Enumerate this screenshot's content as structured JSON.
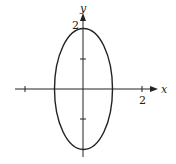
{
  "figure": {
    "type": "ellipse-plot",
    "equation": "x^2 + y^2/4 = 1",
    "axes": {
      "x_label": "x",
      "y_label": "y",
      "x_tick_labels": [
        {
          "value": 2,
          "text": "2"
        }
      ],
      "y_tick_labels": [
        {
          "value": 2,
          "text": "2"
        }
      ],
      "x_ticks": [
        -2,
        2
      ],
      "y_ticks": [
        -1,
        1,
        2
      ]
    },
    "ellipse": {
      "center": [
        0,
        0
      ],
      "semi_axis_x": 1,
      "semi_axis_y": 2
    },
    "colors": {
      "stroke": "#222222",
      "background": "#ffffff"
    }
  }
}
